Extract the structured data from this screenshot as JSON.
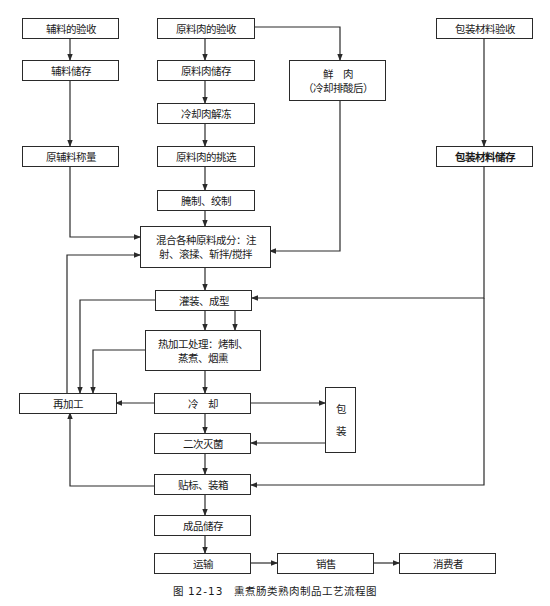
{
  "caption": "图 12-13　熏煮肠类熟肉制品工艺流程图",
  "nodes": {
    "aux_receive": "辅料的验收",
    "aux_store": "辅料储存",
    "aux_weigh": "原辅料称量",
    "meat_receive": "原料肉的验收",
    "meat_store": "原料肉储存",
    "thaw": "冷却肉解冻",
    "select": "原料肉的挑选",
    "cure_grind": "腌制、绞制",
    "fresh_meat": "鲜　肉\n（冷却排酸后）",
    "pack_receive": "包装材料验收",
    "pack_store": "包装材料储存",
    "mix": "混合各种原料成分：注\n射、滚揉、斩拌/搅拌",
    "fill_form": "灌装、成型",
    "heat": "热加工处理：烤制、\n蒸煮、烟熏",
    "rework": "再加工",
    "cool": "冷　却",
    "packaging": [
      "包",
      "装"
    ],
    "sterilize": "二次灭菌",
    "label_box": "贴标、装箱",
    "product_store": "成品储存",
    "transport": "运输",
    "sales": "销售",
    "consumer": "消费者"
  },
  "colors": {
    "line": "#2a2a2a",
    "background": "#ffffff"
  }
}
